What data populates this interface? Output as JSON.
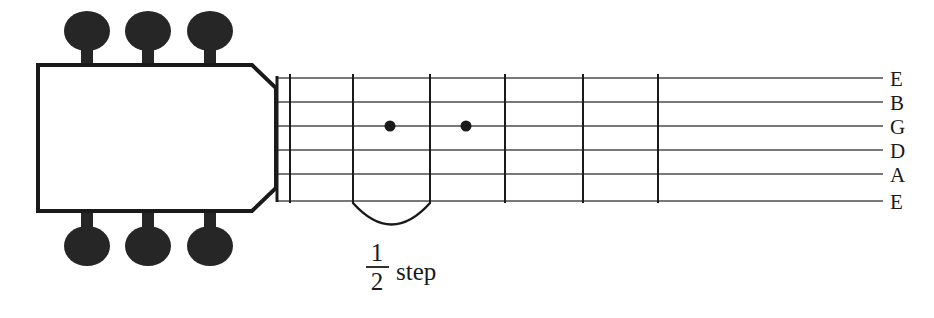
{
  "diagram": {
    "name": "guitar-neck-half-step-diagram",
    "background_color": "#ffffff",
    "ink_color": "#1a1a1a",
    "headstock": {
      "name": "guitar-headstock",
      "outline_color": "#1a1a1a",
      "fill_color": "#ffffff",
      "stroke_width": 3
    },
    "tuning_pegs": {
      "count": 6,
      "color": "#262626",
      "top_labels": [
        "tuner-peg-top-1",
        "tuner-peg-top-2",
        "tuner-peg-top-3"
      ],
      "bottom_labels": [
        "tuner-peg-bottom-1",
        "tuner-peg-bottom-2",
        "tuner-peg-bottom-3"
      ]
    },
    "nut": {
      "name": "nut",
      "color": "#1a1a1a"
    },
    "frets": {
      "count": 6,
      "color": "#1a1a1a",
      "labels": [
        "fret-1",
        "fret-2",
        "fret-3",
        "fret-4",
        "fret-5",
        "fret-6"
      ]
    },
    "strings": {
      "count": 6,
      "color": "#4d4d4d",
      "labels": [
        "E",
        "B",
        "G",
        "D",
        "A",
        "E"
      ],
      "label_names": [
        "string-label-e-high",
        "string-label-b",
        "string-label-g",
        "string-label-d",
        "string-label-a",
        "string-label-e-low"
      ]
    },
    "note_dots": {
      "color": "#1a1a1a",
      "count": 2,
      "on_string": "G",
      "labels": [
        "note-dot-fret-2",
        "note-dot-fret-3"
      ]
    },
    "annotation": {
      "name": "half-step-annotation",
      "bracket_name": "half-step-arc",
      "fraction_numerator": "1",
      "fraction_denominator": "2",
      "word": "step",
      "full_text": "1/2 step"
    }
  }
}
